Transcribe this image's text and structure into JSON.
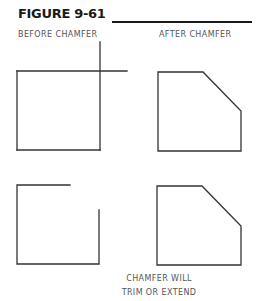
{
  "figure": {
    "title": "FIGURE 9-61",
    "line_color": "#333333"
  },
  "labels": {
    "before": "BEFORE CHAMFER",
    "after": "AFTER CHAMFER"
  },
  "caption": {
    "line1": "CHAMFER WILL",
    "line2": "TRIM OR EXTEND"
  },
  "panels": [
    {
      "name": "before-overlapping-lines",
      "description": "Square with top and right edges extended past corner"
    },
    {
      "name": "after-chamfer-top",
      "description": "Square with chamfered top-right corner"
    },
    {
      "name": "before-gap-lines",
      "description": "Square with top and right edges stopping short of corner"
    },
    {
      "name": "after-chamfer-bottom",
      "description": "Square with chamfered top-right corner"
    }
  ]
}
